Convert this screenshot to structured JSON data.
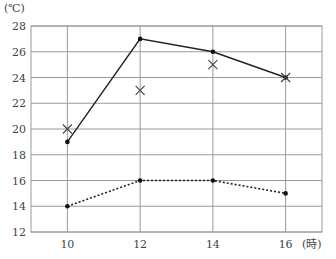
{
  "chart_data": {
    "type": "line",
    "title": "",
    "xlabel": "(時)",
    "ylabel": "(℃)",
    "x": [
      10,
      12,
      14,
      16
    ],
    "x_ticks": [
      "10",
      "12",
      "14",
      "16"
    ],
    "y_ticks": [
      "12",
      "14",
      "16",
      "18",
      "20",
      "22",
      "24",
      "26",
      "28"
    ],
    "xlim": [
      9,
      17
    ],
    "ylim": [
      12,
      28
    ],
    "grid": true,
    "series": [
      {
        "name": "solid line",
        "style": "solid",
        "marker": "dot",
        "values": [
          19,
          27,
          26,
          24
        ]
      },
      {
        "name": "cross marks",
        "style": "none",
        "marker": "x",
        "values": [
          20,
          23,
          25,
          24
        ]
      },
      {
        "name": "dotted line",
        "style": "dotted",
        "marker": "dot",
        "values": [
          14,
          16,
          16,
          15
        ]
      }
    ]
  },
  "labels": {
    "y_unit": "(℃)",
    "x_unit": "(時)"
  },
  "colors": {
    "grid": "#9a9a9a",
    "line": "#222222",
    "marker": "#111111"
  }
}
